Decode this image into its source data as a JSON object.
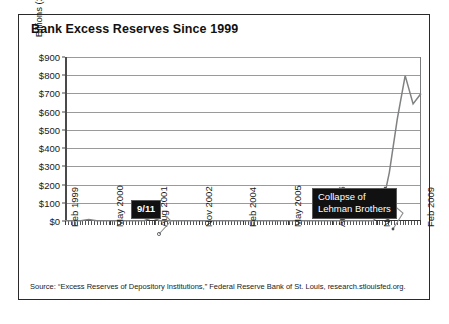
{
  "chart_data": {
    "type": "line",
    "title": "Bank Excess Reserves Since 1999",
    "xlabel": "",
    "ylabel": "Billions (2009 Dollars)",
    "ylim": [
      0,
      900
    ],
    "grid": true,
    "legend": "none",
    "ytick_labels": [
      "$900",
      "$800",
      "$700",
      "$600",
      "$500",
      "$400",
      "$300",
      "$200",
      "$100",
      "$0"
    ],
    "ytick_values": [
      900,
      800,
      700,
      600,
      500,
      400,
      300,
      200,
      100,
      0
    ],
    "xtick_labels": [
      "Feb 1999",
      "May 2000",
      "Aug 2001",
      "Nov 2002",
      "Feb 2004",
      "May 2005",
      "Aug 2006",
      "Nov 2007",
      "Feb 2009"
    ],
    "series": [
      {
        "name": "Excess Reserves",
        "x": [
          "Feb 1999",
          "May 1999",
          "Aug 1999",
          "Nov 1999",
          "Feb 2000",
          "May 2000",
          "Aug 2000",
          "Nov 2000",
          "Feb 2001",
          "May 2001",
          "Aug 2001",
          "Sep 2001",
          "Nov 2001",
          "Feb 2002",
          "May 2002",
          "Aug 2002",
          "Nov 2002",
          "Feb 2003",
          "May 2003",
          "Aug 2003",
          "Nov 2003",
          "Feb 2004",
          "May 2004",
          "Aug 2004",
          "Nov 2004",
          "Feb 2005",
          "May 2005",
          "Aug 2005",
          "Nov 2005",
          "Feb 2006",
          "May 2006",
          "Aug 2006",
          "Nov 2006",
          "Feb 2007",
          "May 2007",
          "Aug 2007",
          "Nov 2007",
          "Feb 2008",
          "May 2008",
          "Aug 2008",
          "Sep 2008",
          "Oct 2008",
          "Nov 2008",
          "Dec 2008",
          "Jan 2009",
          "Feb 2009"
        ],
        "values": [
          1,
          1,
          1,
          8,
          1,
          1,
          1,
          1,
          1,
          1,
          2,
          19,
          2,
          1,
          1,
          1,
          1,
          1,
          1,
          1,
          1,
          1,
          1,
          1,
          1,
          1,
          1,
          1,
          1,
          1,
          1,
          1,
          2,
          1,
          1,
          2,
          2,
          2,
          2,
          2,
          60,
          267,
          559,
          798,
          643,
          700
        ],
        "color": "#7f8183"
      }
    ],
    "annotations": [
      {
        "id": "911",
        "text": "9/11",
        "style": "black-box-white-text"
      },
      {
        "id": "lehman",
        "line1": "Collapse of",
        "line2": "Lehman Brothers",
        "style": "black-box-white-text"
      }
    ]
  },
  "source_note": "Source: “Excess Reserves of Depository Institutions,” Federal Reserve Bank of St. Louis, research.stlouisfed.org."
}
